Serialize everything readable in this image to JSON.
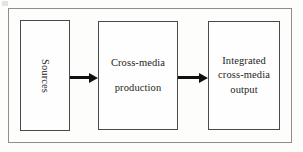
{
  "diagram": {
    "type": "process-flow",
    "orientation": "left-to-right",
    "background_color": "#fdfdfc",
    "frame_color": "#8d8d8d",
    "box_border_color": "#4a4a4a",
    "arrow_color": "#101010",
    "nodes": [
      {
        "id": "sources",
        "label": "Sources",
        "lines": [
          "Sources"
        ],
        "text_orientation": "vertical"
      },
      {
        "id": "production",
        "label": "Cross-media production",
        "lines": [
          "Cross-media",
          "production"
        ],
        "text_orientation": "horizontal"
      },
      {
        "id": "output",
        "label": "Integrated cross-media output",
        "lines": [
          "Integrated",
          "cross-media",
          "output"
        ],
        "text_orientation": "horizontal"
      }
    ],
    "arrows": [
      {
        "id": "sources-to-production",
        "from": "sources",
        "to": "production",
        "style": "solid-filled-head"
      },
      {
        "id": "production-to-output",
        "from": "production",
        "to": "output",
        "style": "solid-filled-head"
      }
    ]
  }
}
